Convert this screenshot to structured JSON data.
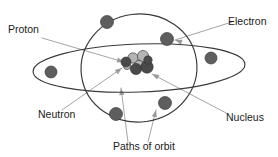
{
  "diagram": {
    "background_color": "#ffffff",
    "orbit_stroke_color": "#3a3a3a",
    "leader_line_color": "#9a9a9a",
    "label_text_color": "#1b1b1b",
    "electron_color": "#5e5e5e",
    "proton_color": "#b4b4b4",
    "neutron_color": "#4a4a4a",
    "labels": [
      {
        "id": "proton",
        "text": "Proton",
        "x": 8,
        "y": 33,
        "anchor": "start"
      },
      {
        "id": "electron",
        "text": "Electron",
        "x": 228,
        "y": 25,
        "anchor": "start"
      },
      {
        "id": "neutron",
        "text": "Neutron",
        "x": 38,
        "y": 118,
        "anchor": "start"
      },
      {
        "id": "nucleus",
        "text": "Nucleus",
        "x": 226,
        "y": 121,
        "anchor": "start"
      },
      {
        "id": "paths-of-orbit",
        "text": "Paths of orbit",
        "x": 113,
        "y": 150,
        "anchor": "start"
      }
    ],
    "orbits": [
      {
        "id": "vertical-orbit",
        "cx": 139,
        "cy": 68,
        "rx": 58,
        "ry": 54,
        "rotate": -8
      },
      {
        "id": "horizontal-orbit",
        "cx": 139,
        "cy": 68,
        "rx": 106,
        "ry": 24,
        "rotate": -2
      }
    ],
    "electrons": [
      {
        "id": "electron-top-left",
        "cx": 107,
        "cy": 22,
        "r": 6.5
      },
      {
        "id": "electron-top-right",
        "cx": 167,
        "cy": 39,
        "r": 6.5
      },
      {
        "id": "electron-left",
        "cx": 51,
        "cy": 72,
        "r": 6.0
      },
      {
        "id": "electron-right",
        "cx": 211,
        "cy": 58,
        "r": 6.0
      },
      {
        "id": "electron-bottom-left",
        "cx": 116,
        "cy": 114,
        "r": 6.5
      },
      {
        "id": "electron-bottom-right",
        "cx": 165,
        "cy": 103,
        "r": 6.5
      }
    ],
    "nucleus_particles": [
      {
        "id": "proton-1",
        "cx": 133,
        "cy": 58,
        "r": 5.2,
        "kind": "proton"
      },
      {
        "id": "proton-2",
        "cx": 143,
        "cy": 56,
        "r": 5.6,
        "kind": "proton"
      },
      {
        "id": "proton-3",
        "cx": 139,
        "cy": 65,
        "r": 4.6,
        "kind": "proton"
      },
      {
        "id": "proton-4",
        "cx": 127,
        "cy": 66,
        "r": 3.6,
        "kind": "proton"
      },
      {
        "id": "neutron-1",
        "cx": 126,
        "cy": 62,
        "r": 5.0,
        "kind": "neutron"
      },
      {
        "id": "neutron-2",
        "cx": 136,
        "cy": 69,
        "r": 5.6,
        "kind": "neutron"
      },
      {
        "id": "neutron-3",
        "cx": 147,
        "cy": 67,
        "r": 6.2,
        "kind": "neutron"
      },
      {
        "id": "neutron-4",
        "cx": 148,
        "cy": 60,
        "r": 4.2,
        "kind": "neutron"
      }
    ],
    "leaders": [
      {
        "id": "leader-proton",
        "d": "M 42 38 L 124 62",
        "arrow_at": [
          124,
          62
        ],
        "arrow_angle": 16
      },
      {
        "id": "leader-electron",
        "d": "M 232 22 L 175 40",
        "arrow_at": [
          175,
          40
        ],
        "arrow_angle": 198
      },
      {
        "id": "leader-neutron",
        "d": "M 62 110 L 122 68",
        "arrow_at": [
          122,
          68
        ],
        "arrow_angle": -35
      },
      {
        "id": "leader-nucleus",
        "d": "M 228 114 L 152 74",
        "arrow_at": [
          152,
          74
        ],
        "arrow_angle": 208
      },
      {
        "id": "leader-orbit-1",
        "d": "M 128 142 L 121 88",
        "arrow_at": [
          121,
          88
        ],
        "arrow_angle": -97
      },
      {
        "id": "leader-orbit-2",
        "d": "M 148 142 L 156 110",
        "arrow_at": [
          156,
          110
        ],
        "arrow_angle": -76
      }
    ]
  }
}
